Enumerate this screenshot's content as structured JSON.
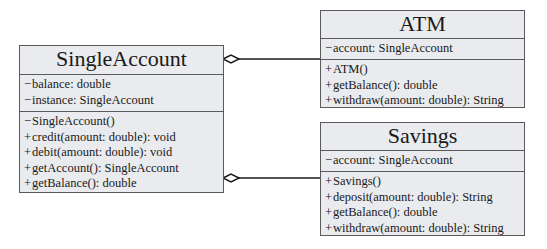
{
  "classes": {
    "single_account": {
      "name": "SingleAccount",
      "attributes": [
        {
          "vis": "−",
          "text": "balance: double"
        },
        {
          "vis": "−",
          "text": "instance: SingleAccount"
        }
      ],
      "methods": [
        {
          "vis": "−",
          "text": "SingleAccount()"
        },
        {
          "vis": "+",
          "text": "credit(amount: double): void"
        },
        {
          "vis": "+",
          "text": "debit(amount: double): void"
        },
        {
          "vis": "+",
          "text": "getAccount(): SingleAccount"
        },
        {
          "vis": "+",
          "text": "getBalance(): double"
        }
      ]
    },
    "atm": {
      "name": "ATM",
      "attributes": [
        {
          "vis": "−",
          "text": "account: SingleAccount"
        }
      ],
      "methods": [
        {
          "vis": "+",
          "text": "ATM()"
        },
        {
          "vis": "+",
          "text": "getBalance(): double"
        },
        {
          "vis": "+",
          "text": "withdraw(amount: double): String"
        }
      ]
    },
    "savings": {
      "name": "Savings",
      "attributes": [
        {
          "vis": "−",
          "text": "account: SingleAccount"
        }
      ],
      "methods": [
        {
          "vis": "+",
          "text": "Savings()"
        },
        {
          "vis": "+",
          "text": "deposit(amount: double): String"
        },
        {
          "vis": "+",
          "text": "getBalance(): double"
        },
        {
          "vis": "+",
          "text": "withdraw(amount: double): String"
        }
      ]
    }
  },
  "relationships": [
    {
      "type": "aggregation",
      "whole": "SingleAccount",
      "part": "ATM"
    },
    {
      "type": "aggregation",
      "whole": "SingleAccount",
      "part": "Savings"
    }
  ],
  "colors": {
    "box_fill": "#e9ebee",
    "box_border": "#5a5a5a",
    "line": "#1a1a1a"
  }
}
